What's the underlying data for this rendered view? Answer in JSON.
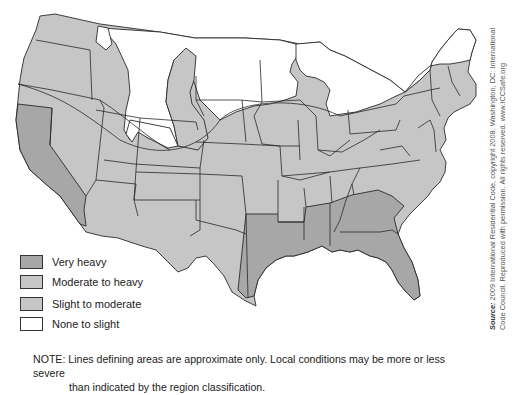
{
  "map": {
    "subject": "Termite infestation probability map, contiguous United States",
    "colors": {
      "very_heavy": "#a7a7a7",
      "moderate_to_heavy": "#c6c6c6",
      "slight_to_moderate": "#c6c6c6",
      "none_to_slight": "#ffffff",
      "border": "#2a2a2a"
    },
    "regions": {
      "very_heavy": [
        "California",
        "East Texas",
        "Louisiana",
        "Mississippi",
        "Alabama",
        "Georgia",
        "South Carolina",
        "Florida"
      ],
      "none_to_slight": [
        "Northern Montana",
        "Northern Wyoming",
        "North Dakota",
        "Upper Minnesota",
        "Northern Wisconsin",
        "Upper Michigan",
        "Northern New York",
        "Northern New England"
      ]
    }
  },
  "legend": {
    "items": [
      {
        "label": "Very heavy",
        "color": "#a7a7a7"
      },
      {
        "label": "Moderate to heavy",
        "color": "#c6c6c6"
      },
      {
        "label": "Slight to moderate",
        "color": "#c6c6c6"
      },
      {
        "label": "None to slight",
        "color": "#ffffff"
      }
    ]
  },
  "note": {
    "line1": "NOTE: Lines defining areas are approximate only. Local conditions may be more or less severe",
    "line2": "than indicated by the region classification."
  },
  "source": {
    "label": "Source:",
    "line1": "2009 International Residential Code, copyright 2008. Washington, DC: International",
    "line2": "Code Council. Reproduced with permission. All rights reserved. www.ICCSafe.org"
  }
}
